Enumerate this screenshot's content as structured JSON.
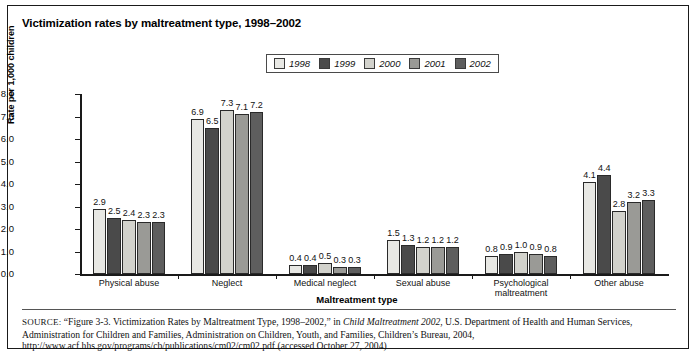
{
  "figure": {
    "title": "Victimization rates by maltreatment type, 1998–2002",
    "source_prefix": "SOURCE:",
    "source_part1": " “Figure 3-3. Victimization Rates by Maltreatment Type, 1998–2002,” in ",
    "source_italic": "Child Maltreatment 2002",
    "source_part2": ", U.S. Department of Health and Human Services, Administration for Children and Families, Administration on Children, Youth, and Families, Children’s Bureau, 2004, http://www.acf.hhs.gov/programs/cb/publications/cm02/cm02.pdf (accessed October 27, 2004)"
  },
  "chart_data": {
    "type": "bar",
    "title": "Victimization rates by maltreatment type, 1998–2002",
    "xlabel": "Maltreatment type",
    "ylabel": "Rate per 1,000 children",
    "ylim": [
      0.0,
      8.0
    ],
    "ytick_step": 1.0,
    "ytick_labels": [
      "0.0",
      "1.0",
      "2.0",
      "3.0",
      "4.0",
      "5.0",
      "6.0",
      "7.0",
      "8.0"
    ],
    "grid": false,
    "legend_position": "top-center",
    "categories": [
      "Physical abuse",
      "Neglect",
      "Medical neglect",
      "Sexual abuse",
      "Psychological maltreatment",
      "Other abuse"
    ],
    "series": [
      {
        "name": "1998",
        "color": "#e8e8e4",
        "values": [
          2.9,
          6.9,
          0.4,
          1.5,
          0.8,
          4.1
        ],
        "labels": [
          "2.9",
          "6.9",
          "0.4",
          "1.5",
          "0.8",
          "4.1"
        ]
      },
      {
        "name": "1999",
        "color": "#4a4a4a",
        "values": [
          2.5,
          6.5,
          0.4,
          1.3,
          0.9,
          4.4
        ],
        "labels": [
          "2.5",
          "6.5",
          "0.4",
          "1.3",
          "0.9",
          "4.4"
        ]
      },
      {
        "name": "2000",
        "color": "#d2d2cc",
        "values": [
          2.4,
          7.3,
          0.5,
          1.2,
          1.0,
          2.8
        ],
        "labels": [
          "2.4",
          "7.3",
          "0.5",
          "1.2",
          "1.0",
          "2.8"
        ]
      },
      {
        "name": "2001",
        "color": "#9a9a96",
        "values": [
          2.3,
          7.1,
          0.3,
          1.2,
          0.9,
          3.2
        ],
        "labels": [
          "2.3",
          "7.1",
          "0.3",
          "1.2",
          "0.9",
          "3.2"
        ]
      },
      {
        "name": "2002",
        "color": "#5e5e5e",
        "values": [
          2.3,
          7.2,
          0.3,
          1.2,
          0.8,
          3.3
        ],
        "labels": [
          "2.3",
          "7.2",
          "0.3",
          "1.2",
          "0.8",
          "3.3"
        ]
      }
    ]
  }
}
